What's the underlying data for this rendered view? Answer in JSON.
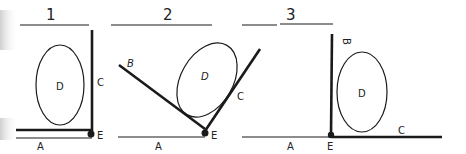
{
  "panels": [
    {
      "number": "1",
      "labels": {
        "A": "A",
        "C": "C",
        "D": "D",
        "E": "E"
      }
    },
    {
      "number": "2",
      "labels": {
        "A": "A",
        "B": "B",
        "C": "C",
        "D": "D",
        "E": "E"
      }
    },
    {
      "number": "3",
      "labels": {
        "A": "A",
        "B": "B",
        "C": "C",
        "D": "D",
        "E": "E"
      }
    }
  ],
  "colors": {
    "ink": "#1a1a1a",
    "background": "#ffffff"
  }
}
